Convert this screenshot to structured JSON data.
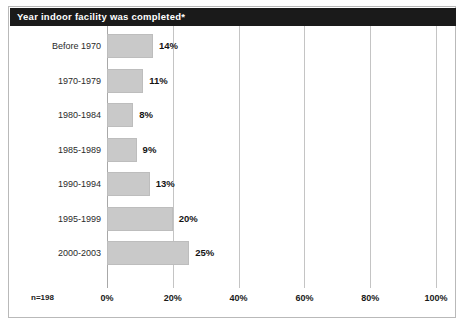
{
  "chart": {
    "title": "Year indoor facility was completed*",
    "sample_size_label": "n=198"
  },
  "chart_data": {
    "type": "bar",
    "orientation": "horizontal",
    "title": "Year indoor facility was completed*",
    "xlabel": "",
    "ylabel": "",
    "categories": [
      "Before 1970",
      "1970-1979",
      "1980-1984",
      "1985-1989",
      "1990-1994",
      "1995-1999",
      "2000-2003"
    ],
    "values": [
      14,
      11,
      8,
      9,
      13,
      20,
      25
    ],
    "value_labels": [
      "14%",
      "11%",
      "8%",
      "9%",
      "13%",
      "20%",
      "25%"
    ],
    "xlim": [
      0,
      100
    ],
    "xticks": [
      0,
      20,
      40,
      60,
      80,
      100
    ],
    "xtick_labels": [
      "0%",
      "20%",
      "40%",
      "60%",
      "80%",
      "100%"
    ],
    "grid": true,
    "grid_axis": "x",
    "legend": false,
    "annotations": [
      "n=198"
    ],
    "bar_color": "#c9c9c9",
    "title_background": "#1a1a1a",
    "title_color": "#ffffff",
    "gridline_color": "#c4c4c4"
  }
}
